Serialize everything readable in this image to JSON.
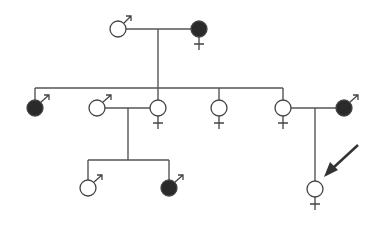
{
  "colors": {
    "affected": "#2a2a2a",
    "unaffected": "#ffffff",
    "line": "#555555"
  },
  "individuals": [
    {
      "id": "I-1",
      "generation": 1,
      "sex": "male",
      "affected": false,
      "label": "Generation I father"
    },
    {
      "id": "I-2",
      "generation": 1,
      "sex": "female",
      "affected": true,
      "label": "Generation I mother"
    },
    {
      "id": "II-1",
      "generation": 2,
      "sex": "male",
      "affected": true,
      "label": "Son 1"
    },
    {
      "id": "II-2",
      "generation": 2,
      "sex": "male",
      "affected": false,
      "label": "Spouse of daughter 1"
    },
    {
      "id": "II-3",
      "generation": 2,
      "sex": "female",
      "affected": false,
      "label": "Daughter 1"
    },
    {
      "id": "II-4",
      "generation": 2,
      "sex": "female",
      "affected": false,
      "label": "Daughter 2"
    },
    {
      "id": "II-5",
      "generation": 2,
      "sex": "female",
      "affected": false,
      "label": "Daughter 3"
    },
    {
      "id": "II-6",
      "generation": 2,
      "sex": "male",
      "affected": true,
      "label": "Spouse of daughter 3"
    },
    {
      "id": "III-1",
      "generation": 3,
      "sex": "male",
      "affected": false,
      "label": "Grandson 1"
    },
    {
      "id": "III-2",
      "generation": 3,
      "sex": "male",
      "affected": true,
      "label": "Grandson 2"
    },
    {
      "id": "III-3",
      "generation": 3,
      "sex": "female",
      "affected": false,
      "label": "Proband",
      "proband": true
    }
  ],
  "proband_marker": "arrow"
}
